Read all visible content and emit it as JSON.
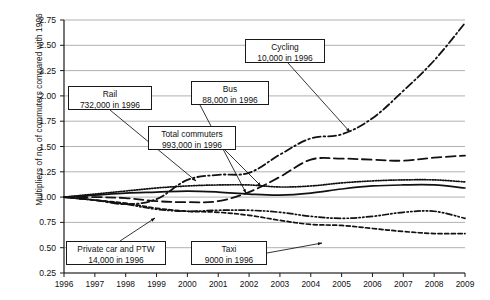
{
  "chart_data": {
    "type": "line",
    "title": "",
    "xlabel": "",
    "ylabel": "Multipliers of no. of commuters compared with 1996",
    "categories": [
      1996,
      1997,
      1998,
      1999,
      2000,
      2001,
      2002,
      2003,
      2004,
      2005,
      2006,
      2007,
      2008,
      2009
    ],
    "x": [
      1996,
      1997,
      1998,
      1999,
      2000,
      2001,
      2002,
      2003,
      2004,
      2005,
      2006,
      2007,
      2008,
      2009
    ],
    "xlim": [
      1996,
      2009
    ],
    "ylim": [
      0.25,
      2.75
    ],
    "ytick_labels": [
      "2.75",
      "2.50",
      "2.25",
      "2.00",
      "1.75",
      "1.50",
      "1.25",
      "1.00",
      "0.75",
      "0.50",
      "0.25"
    ],
    "ytick_values": [
      2.75,
      2.5,
      2.25,
      2.0,
      1.75,
      1.5,
      1.25,
      1.0,
      0.75,
      0.5,
      0.25
    ],
    "xtick_labels": [
      "1996",
      "1997",
      "1998",
      "1999",
      "2000",
      "2001",
      "2002",
      "2003",
      "2004",
      "2005",
      "2006",
      "2007",
      "2008",
      "2009"
    ],
    "grid": true,
    "grid_axis": "y",
    "grid_color": "#a8a8a8",
    "legend_position": "none",
    "series": [
      {
        "name": "Cycling",
        "style": "dash-dot",
        "baseline_1996": "10,000",
        "values": [
          1.0,
          0.97,
          0.93,
          0.98,
          1.17,
          1.22,
          1.24,
          1.42,
          1.58,
          1.62,
          1.78,
          2.05,
          2.35,
          2.72
        ]
      },
      {
        "name": "Bus",
        "style": "long-dash",
        "baseline_1996": "88,000",
        "values": [
          1.0,
          1.0,
          0.99,
          0.96,
          0.95,
          0.96,
          1.05,
          1.2,
          1.37,
          1.38,
          1.37,
          1.36,
          1.39,
          1.41
        ]
      },
      {
        "name": "Rail",
        "style": "dotted",
        "baseline_1996": "732,000",
        "values": [
          1.0,
          1.03,
          1.06,
          1.09,
          1.11,
          1.12,
          1.12,
          1.1,
          1.11,
          1.14,
          1.16,
          1.17,
          1.17,
          1.15
        ]
      },
      {
        "name": "Total commuters",
        "style": "solid",
        "baseline_1996": "993,000",
        "values": [
          1.0,
          1.02,
          1.04,
          1.05,
          1.06,
          1.05,
          1.03,
          1.02,
          1.04,
          1.08,
          1.11,
          1.12,
          1.12,
          1.09
        ]
      },
      {
        "name": "Private car and PTW",
        "style": "dash-dot-dot",
        "baseline_1996": "14,000",
        "values": [
          1.0,
          0.97,
          0.93,
          0.88,
          0.86,
          0.87,
          0.87,
          0.85,
          0.81,
          0.79,
          0.81,
          0.85,
          0.86,
          0.79
        ]
      },
      {
        "name": "Taxi",
        "style": "short-dash",
        "baseline_1996": "9000",
        "values": [
          1.0,
          0.97,
          0.94,
          0.89,
          0.86,
          0.85,
          0.82,
          0.77,
          0.73,
          0.72,
          0.69,
          0.66,
          0.64,
          0.64
        ]
      }
    ],
    "annotations": [
      {
        "id": "rail",
        "label": "Rail",
        "sub": "732,000 in 1996",
        "points_to_year": 1998
      },
      {
        "id": "bus",
        "label": "Bus",
        "sub": "88,000 in 1996",
        "points_to_year": 2002
      },
      {
        "id": "cycling",
        "label": "Cycling",
        "sub": "10,000 in 1996",
        "points_to_year": 2003
      },
      {
        "id": "total",
        "label": "Total commuters",
        "sub": "993,000 in 1996",
        "points_to_year": 2001
      },
      {
        "id": "car",
        "label": "Private car and PTW",
        "sub": "14,000 in 1996",
        "points_to_year": 1999
      },
      {
        "id": "taxi",
        "label": "Taxi",
        "sub": "9000 in 1996",
        "points_to_year": 2004
      }
    ]
  }
}
